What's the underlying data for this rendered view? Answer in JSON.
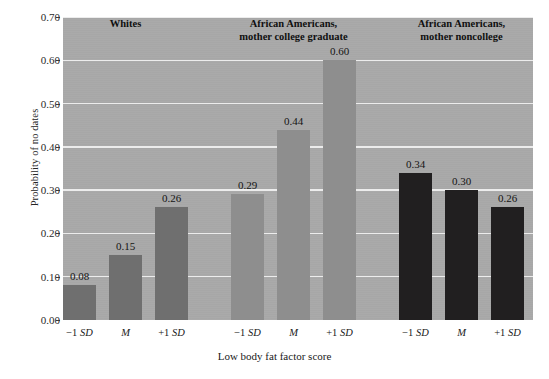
{
  "chart_data": {
    "type": "bar",
    "title": "",
    "xlabel": "Low body fat factor score",
    "ylabel": "Probability of no dates",
    "ylim": [
      0.0,
      0.7
    ],
    "ytick_labels": [
      "0.00",
      "0.10",
      "0.20",
      "0.30",
      "0.40",
      "0.50",
      "0.60",
      "0.70"
    ],
    "ytick_values": [
      0.0,
      0.1,
      0.2,
      0.3,
      0.4,
      0.5,
      0.6,
      0.7
    ],
    "grid": "horizontal",
    "legend": "none",
    "categories": [
      "-1 SD",
      "M",
      "+1 SD"
    ],
    "groups": [
      {
        "name": "Whites",
        "header": "Whites",
        "color": "#6f6f6f",
        "categories": [
          "-1 SD",
          "M",
          "+1 SD"
        ],
        "values": [
          0.08,
          0.15,
          0.26
        ],
        "value_labels": [
          "0.08",
          "0.15",
          "0.26"
        ]
      },
      {
        "name": "African Americans, mother college graduate",
        "header": "African Americans,\nmother college graduate",
        "color": "#8e8e8e",
        "categories": [
          "-1 SD",
          "M",
          "+1 SD"
        ],
        "values": [
          0.29,
          0.44,
          0.6
        ],
        "value_labels": [
          "0.29",
          "0.44",
          "0.60"
        ]
      },
      {
        "name": "African Americans, mother noncollege",
        "header": "African Americans,\nmother noncollege",
        "color": "#211f20",
        "categories": [
          "-1 SD",
          "M",
          "+1 SD"
        ],
        "values": [
          0.34,
          0.3,
          0.26
        ],
        "value_labels": [
          "0.34",
          "0.30",
          "0.26"
        ]
      }
    ]
  },
  "axes": {
    "y_title": "Probability of no dates",
    "x_title": "Low body fat factor score",
    "y_ticks": [
      {
        "label": "0.70"
      },
      {
        "label": "0.60"
      },
      {
        "label": "0.50"
      },
      {
        "label": "0.40"
      },
      {
        "label": "0.30"
      },
      {
        "label": "0.20"
      },
      {
        "label": "0.10"
      },
      {
        "label": "0.00"
      }
    ],
    "x_ticks": [
      {
        "minus": "−1 ",
        "em": "SD"
      },
      {
        "minus": "",
        "em": "M"
      },
      {
        "minus": "+1 ",
        "em": "SD"
      }
    ]
  },
  "style": {
    "plot_background": "#a9a9a9",
    "gridline_color": "#f2f2f2",
    "page_background": "#ffffff",
    "text_color": "#1a1a1a"
  }
}
